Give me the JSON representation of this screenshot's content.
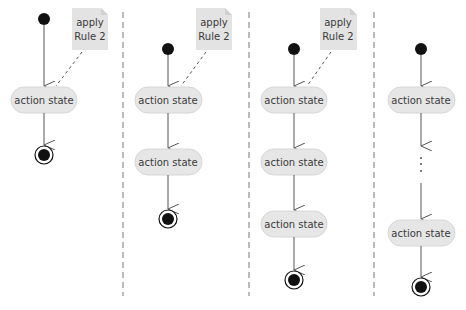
{
  "diagram": {
    "type": "UML activity diagram — sequence structure (Rule 2 application)",
    "colors": {
      "background": "#ffffff",
      "action_fill": "#e6e6e6",
      "action_stroke": "#d6d6d6",
      "note_fill": "#e3e3e3",
      "node": "#111111",
      "line": "#555555",
      "divider": "#777777"
    },
    "panels": [
      {
        "id": "step1",
        "note": {
          "line1": "apply",
          "line2": "Rule 2"
        },
        "actions": [
          "action state"
        ]
      },
      {
        "id": "step2",
        "note": {
          "line1": "apply",
          "line2": "Rule 2"
        },
        "actions": [
          "action state",
          "action state"
        ]
      },
      {
        "id": "step3",
        "note": {
          "line1": "apply",
          "line2": "Rule 2"
        },
        "actions": [
          "action state",
          "action state",
          "action state"
        ]
      },
      {
        "id": "step4",
        "note": null,
        "actions": [
          "action state",
          "action state"
        ],
        "ellipsis": "⋮"
      }
    ]
  }
}
